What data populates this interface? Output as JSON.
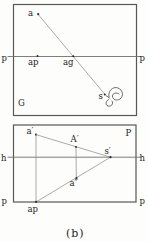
{
  "figure": {
    "caption": "(b)",
    "colors": {
      "frame": "#585858",
      "axis_line": "#6f6f6f",
      "construction_line": "#8f8f8f",
      "text": "#1c1c1c",
      "background": "#fdfdfc"
    },
    "panel_g": {
      "corner_label": "G",
      "ground_line_left_label": "p",
      "ground_line_right_label": "p",
      "point_a_label": "a",
      "point_ap_label": "ap",
      "point_ag_label": "ag",
      "point_s_label": "s"
    },
    "panel_p": {
      "corner_label": "P",
      "horizon_left_label": "h",
      "horizon_right_label": "h",
      "ground_left_label": "p",
      "ground_right_label": "p",
      "point_a_prime_label": "a′",
      "point_A_prime_label": "A′",
      "point_s_prime_label": "s′",
      "point_a_dblprime_label": "a″",
      "point_ap_label": "ap"
    }
  }
}
